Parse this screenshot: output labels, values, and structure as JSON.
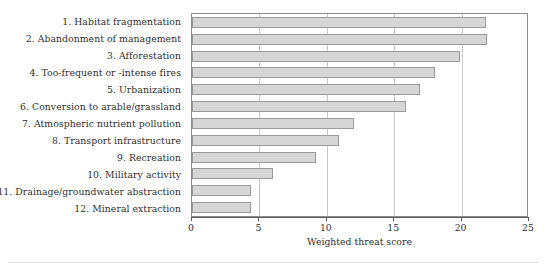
{
  "chart_data": {
    "type": "bar",
    "orientation": "horizontal",
    "title": "",
    "xlabel": "Weighted threat score",
    "ylabel": "",
    "xlim": [
      0,
      25
    ],
    "ylim": [],
    "grid": true,
    "legend": "none",
    "xticks": [
      "0",
      "5",
      "10",
      "15",
      "20",
      "25"
    ],
    "xtick_values": [
      0,
      5,
      10,
      15,
      20,
      25
    ],
    "categories": [
      "1. Habitat fragmentation",
      "2. Abandonment of management",
      "3. Afforestation",
      "4. Too-frequent or -intense fires",
      "5. Urbanization",
      "6. Conversion to arable/grassland",
      "7. Atmospheric nutrient pollution",
      "8. Transport infrastructure",
      "9. Recreation",
      "10. Military activity",
      "11. Drainage/groundwater abstraction",
      "12. Mineral extraction"
    ],
    "values": [
      21.8,
      21.9,
      19.9,
      18.0,
      16.9,
      15.9,
      12.0,
      10.9,
      9.2,
      6.0,
      4.4,
      4.4
    ],
    "bar_color": "#d6d6d6",
    "bar_edge_color": "#9a9a9a",
    "axis_color": "#5d5d5d",
    "grid_color": "#c9c9c9"
  }
}
